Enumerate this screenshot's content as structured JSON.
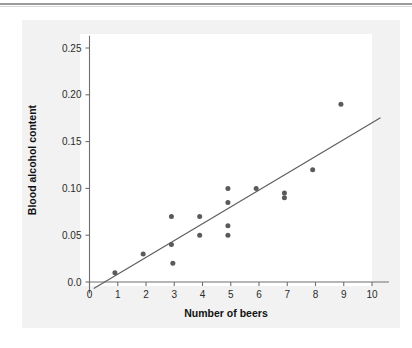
{
  "figure": {
    "background_color": "#f2f2f2",
    "plot_background_color": "#ffffff",
    "point_color": "#5a5a5a",
    "line_color": "#5d5d5d",
    "axis_color": "#6f6f6f"
  },
  "chart_data": {
    "type": "scatter",
    "title": "",
    "xlabel": "Number of beers",
    "ylabel": "Blood alcohol content",
    "xlim": [
      0,
      10.6
    ],
    "ylim": [
      -0.012,
      0.268
    ],
    "xticks": [
      0,
      1,
      2,
      3,
      4,
      5,
      6,
      7,
      8,
      9,
      10
    ],
    "xtick_labels": [
      "0",
      "1",
      "2",
      "3",
      "4",
      "5",
      "6",
      "7",
      "8",
      "9",
      "10"
    ],
    "yticks": [
      0.0,
      0.05,
      0.1,
      0.15,
      0.2,
      0.25
    ],
    "ytick_labels": [
      "0.0",
      "0.05",
      "0.10",
      "0.15",
      "0.20",
      "0.25"
    ],
    "grid": false,
    "legend": null,
    "points": [
      {
        "x": 0.9,
        "y": 0.01
      },
      {
        "x": 1.9,
        "y": 0.03
      },
      {
        "x": 2.9,
        "y": 0.07
      },
      {
        "x": 2.9,
        "y": 0.04
      },
      {
        "x": 2.95,
        "y": 0.02
      },
      {
        "x": 3.9,
        "y": 0.07
      },
      {
        "x": 3.9,
        "y": 0.05
      },
      {
        "x": 4.9,
        "y": 0.1
      },
      {
        "x": 4.9,
        "y": 0.085
      },
      {
        "x": 4.9,
        "y": 0.06
      },
      {
        "x": 4.9,
        "y": 0.05
      },
      {
        "x": 5.9,
        "y": 0.1
      },
      {
        "x": 6.9,
        "y": 0.095
      },
      {
        "x": 6.9,
        "y": 0.09
      },
      {
        "x": 7.9,
        "y": 0.12
      },
      {
        "x": 8.9,
        "y": 0.19
      }
    ],
    "trend_line": {
      "x_start": 0.15,
      "y_start": -0.007,
      "x_end": 10.3,
      "y_end": 0.1755
    }
  }
}
